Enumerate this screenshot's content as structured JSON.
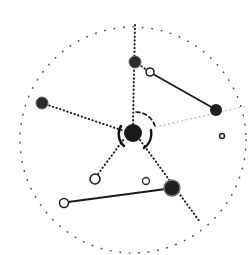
{
  "diagram": {
    "type": "network",
    "colors": {
      "ink": "#1a1a1a",
      "faint": "#bdbdbd",
      "background": "#ffffff"
    },
    "outer_ring": {
      "cx": 133,
      "cy": 140,
      "r": 113
    },
    "nodes": [
      {
        "id": "center",
        "x": 133,
        "y": 133,
        "r": 9,
        "filled": true
      },
      {
        "id": "top",
        "x": 135,
        "y": 62,
        "r": 6,
        "filled": true
      },
      {
        "id": "top-open",
        "x": 150,
        "y": 72,
        "r": 4,
        "filled": false
      },
      {
        "id": "right",
        "x": 216,
        "y": 110,
        "r": 6,
        "filled": true
      },
      {
        "id": "right-small",
        "x": 222,
        "y": 136,
        "r": 2.5,
        "filled": false
      },
      {
        "id": "left",
        "x": 42,
        "y": 103,
        "r": 6,
        "filled": true
      },
      {
        "id": "lower-open",
        "x": 95,
        "y": 179,
        "r": 5,
        "filled": false
      },
      {
        "id": "mid-small",
        "x": 146,
        "y": 181,
        "r": 3.5,
        "filled": false
      },
      {
        "id": "lower-right",
        "x": 172,
        "y": 188,
        "r": 8,
        "filled": true
      },
      {
        "id": "bottom-left",
        "x": 64,
        "y": 203,
        "r": 4.5,
        "filled": false
      }
    ]
  }
}
